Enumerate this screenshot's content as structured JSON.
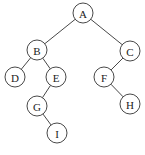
{
  "diagram": {
    "type": "binary-tree",
    "nodes": [
      {
        "id": "A",
        "label": "A",
        "x": 83,
        "y": 13
      },
      {
        "id": "B",
        "label": "B",
        "x": 37,
        "y": 50
      },
      {
        "id": "C",
        "label": "C",
        "x": 130,
        "y": 51
      },
      {
        "id": "D",
        "label": "D",
        "x": 15,
        "y": 77
      },
      {
        "id": "E",
        "label": "E",
        "x": 56,
        "y": 77
      },
      {
        "id": "F",
        "label": "F",
        "x": 104,
        "y": 77
      },
      {
        "id": "G",
        "label": "G",
        "x": 37,
        "y": 106
      },
      {
        "id": "H",
        "label": "H",
        "x": 130,
        "y": 104
      },
      {
        "id": "I",
        "label": "I",
        "x": 57,
        "y": 133
      }
    ],
    "edges": [
      {
        "from": "A",
        "to": "B"
      },
      {
        "from": "A",
        "to": "C"
      },
      {
        "from": "B",
        "to": "D"
      },
      {
        "from": "B",
        "to": "E"
      },
      {
        "from": "E",
        "to": "G"
      },
      {
        "from": "G",
        "to": "I"
      },
      {
        "from": "C",
        "to": "F"
      },
      {
        "from": "F",
        "to": "H"
      }
    ],
    "node_radius": 10,
    "stroke_color": "#333333",
    "fill_color": "#ffffff"
  }
}
